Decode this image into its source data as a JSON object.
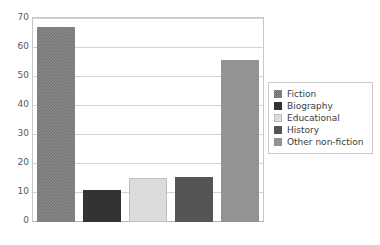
{
  "chart_data": {
    "type": "bar",
    "title": "",
    "subtitle": "",
    "xlabel": "",
    "ylabel": "",
    "categories": [
      "Fiction",
      "Biography",
      "Educational",
      "History",
      "Other non-fiction"
    ],
    "values": [
      67,
      11,
      15,
      15.5,
      55.5
    ],
    "ylim": [
      0,
      70
    ],
    "ytick_labels": [
      "70",
      "60",
      "50",
      "40",
      "30",
      "20",
      "10",
      "0"
    ],
    "ytick_values": [
      70,
      60,
      50,
      40,
      30,
      20,
      10,
      0
    ],
    "xtick_labels": [],
    "grid": "horizontal",
    "legend_position": "right",
    "series": [
      {
        "name": "Book categories",
        "values": [
          67,
          11,
          15,
          15.5,
          55.5
        ]
      }
    ],
    "bar_styles": [
      {
        "category": "Fiction",
        "fill": "#8c8c8c",
        "pattern": "checker"
      },
      {
        "category": "Biography",
        "fill": "#333333",
        "pattern": "solid"
      },
      {
        "category": "Educational",
        "fill": "#dcdcdc",
        "pattern": "solid"
      },
      {
        "category": "History",
        "fill": "#555555",
        "pattern": "solid"
      },
      {
        "category": "Other non-fiction",
        "fill": "#939393",
        "pattern": "solid"
      }
    ]
  },
  "legend": {
    "items": [
      {
        "label": "Fiction",
        "color": "#8c8c8c",
        "pattern": "checker"
      },
      {
        "label": "Biography",
        "color": "#333333",
        "pattern": "solid"
      },
      {
        "label": "Educational",
        "color": "#dcdcdc",
        "pattern": "solid"
      },
      {
        "label": "History",
        "color": "#555555",
        "pattern": "solid"
      },
      {
        "label": "Other non-fiction",
        "color": "#939393",
        "pattern": "solid"
      }
    ]
  },
  "colors": {
    "plot_background": "#ffffff",
    "plot_border": "#c8c8c8",
    "gridline": "#d3d3d3",
    "axis_line": "#b4b4b4",
    "tick_text": "#595959",
    "legend_text": "#3c3c3c",
    "legend_border": "#c8c8c8"
  }
}
